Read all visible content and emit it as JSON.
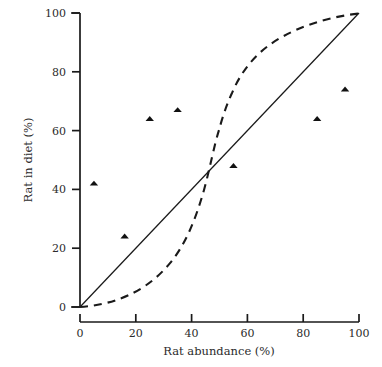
{
  "chart_data": {
    "type": "scatter",
    "title": "",
    "xlabel": "Rat abundance (%)",
    "ylabel": "Rat in diet (%)",
    "xlim": [
      0,
      100
    ],
    "ylim": [
      0,
      100
    ],
    "xticks": [
      0,
      20,
      40,
      60,
      80,
      100
    ],
    "yticks": [
      0,
      20,
      40,
      60,
      80,
      100
    ],
    "xtick_labels": [
      "0",
      "20",
      "40",
      "60",
      "80",
      "100"
    ],
    "ytick_labels": [
      "0",
      "20",
      "40",
      "60",
      "80",
      "100"
    ],
    "grid": false,
    "legend": "none",
    "series": [
      {
        "name": "Observed data",
        "type": "scatter",
        "marker": "triangle",
        "color": "#111111",
        "points": [
          {
            "x": 5,
            "y": 42
          },
          {
            "x": 16,
            "y": 24
          },
          {
            "x": 25,
            "y": 64
          },
          {
            "x": 35,
            "y": 67
          },
          {
            "x": 55,
            "y": 48
          },
          {
            "x": 85,
            "y": 64
          },
          {
            "x": 95,
            "y": 74
          }
        ]
      },
      {
        "name": "No selection (1:1 line)",
        "type": "line",
        "style": "solid",
        "color": "#1a1a1a",
        "points": [
          {
            "x": 0,
            "y": 0
          },
          {
            "x": 100,
            "y": 100
          }
        ]
      },
      {
        "name": "Switching / sigmoid response",
        "type": "line",
        "style": "dashed",
        "color": "#1a1a1a",
        "points": [
          {
            "x": 0,
            "y": 0
          },
          {
            "x": 5,
            "y": 0.6
          },
          {
            "x": 10,
            "y": 1.4
          },
          {
            "x": 15,
            "y": 2.4
          },
          {
            "x": 20,
            "y": 3.6
          },
          {
            "x": 25,
            "y": 5.2
          },
          {
            "x": 30,
            "y": 7.4
          },
          {
            "x": 35,
            "y": 10.4
          },
          {
            "x": 40,
            "y": 15.0
          },
          {
            "x": 44,
            "y": 21.0
          },
          {
            "x": 47,
            "y": 29.0
          },
          {
            "x": 49,
            "y": 39.0
          },
          {
            "x": 50,
            "y": 50.0
          },
          {
            "x": 51,
            "y": 61.0
          },
          {
            "x": 53,
            "y": 71.0
          },
          {
            "x": 56,
            "y": 79.0
          },
          {
            "x": 60,
            "y": 85.0
          },
          {
            "x": 65,
            "y": 89.6
          },
          {
            "x": 70,
            "y": 92.6
          },
          {
            "x": 75,
            "y": 94.8
          },
          {
            "x": 80,
            "y": 96.4
          },
          {
            "x": 85,
            "y": 97.6
          },
          {
            "x": 90,
            "y": 98.6
          },
          {
            "x": 95,
            "y": 99.4
          },
          {
            "x": 100,
            "y": 100
          }
        ]
      }
    ]
  }
}
